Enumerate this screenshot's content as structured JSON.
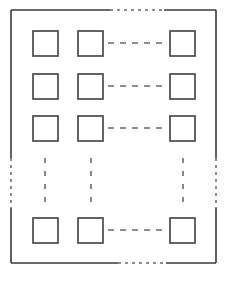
{
  "figure": {
    "background_color": "#ffffff",
    "line_color": "#3a3a3a",
    "dash_color": "#6a6a6a",
    "cell_stroke_color": "#4a4a4a",
    "cell_fill_color": "#ffffff",
    "width": 231,
    "height": 282
  },
  "boundary": {
    "name": "outer-frame",
    "left": 11,
    "top": 10,
    "right": 216,
    "bottom": 263,
    "segments": [
      {
        "id": "top-left-solid",
        "orientation": "horizontal",
        "style": "solid",
        "x1": 11,
        "y1": 10,
        "x2": 110,
        "y2": 10
      },
      {
        "id": "top-middle-dashed",
        "orientation": "horizontal",
        "style": "dashed",
        "x1": 110,
        "y1": 10,
        "x2": 164,
        "y2": 10
      },
      {
        "id": "top-right-solid",
        "orientation": "horizontal",
        "style": "solid",
        "x1": 164,
        "y1": 10,
        "x2": 216,
        "y2": 10
      },
      {
        "id": "right-upper-solid",
        "orientation": "vertical",
        "style": "solid",
        "x1": 216,
        "y1": 10,
        "x2": 216,
        "y2": 158
      },
      {
        "id": "right-middle-dashed",
        "orientation": "vertical",
        "style": "dashed",
        "x1": 216,
        "y1": 158,
        "x2": 216,
        "y2": 208
      },
      {
        "id": "right-lower-solid",
        "orientation": "vertical",
        "style": "solid",
        "x1": 216,
        "y1": 208,
        "x2": 216,
        "y2": 263
      },
      {
        "id": "bottom-left-solid",
        "orientation": "horizontal",
        "style": "solid",
        "x1": 11,
        "y1": 263,
        "x2": 118,
        "y2": 263
      },
      {
        "id": "bottom-middle-dashed",
        "orientation": "horizontal",
        "style": "dashed",
        "x1": 118,
        "y1": 263,
        "x2": 166,
        "y2": 263
      },
      {
        "id": "bottom-right-solid",
        "orientation": "horizontal",
        "style": "solid",
        "x1": 166,
        "y1": 263,
        "x2": 216,
        "y2": 263
      },
      {
        "id": "left-upper-solid",
        "orientation": "vertical",
        "style": "solid",
        "x1": 11,
        "y1": 10,
        "x2": 11,
        "y2": 158
      },
      {
        "id": "left-middle-dashed",
        "orientation": "vertical",
        "style": "dashed",
        "x1": 11,
        "y1": 158,
        "x2": 11,
        "y2": 208
      },
      {
        "id": "left-lower-solid",
        "orientation": "vertical",
        "style": "solid",
        "x1": 11,
        "y1": 208,
        "x2": 11,
        "y2": 263
      }
    ]
  },
  "grid": {
    "rows": 4,
    "columns": 3,
    "cell_width": 25,
    "cell_height": 25,
    "column_x": [
      33,
      78,
      170
    ],
    "row_y": [
      31,
      74,
      116,
      218
    ],
    "row_labels": [
      "row-1",
      "row-2",
      "row-3",
      "row-n"
    ],
    "column_labels": [
      "col-1",
      "col-2",
      "col-n"
    ],
    "cells": [
      {
        "id": "cell-r1c1",
        "x": 33,
        "y": 31
      },
      {
        "id": "cell-r1c2",
        "x": 78,
        "y": 31
      },
      {
        "id": "cell-r1c3",
        "x": 170,
        "y": 31
      },
      {
        "id": "cell-r2c1",
        "x": 33,
        "y": 74
      },
      {
        "id": "cell-r2c2",
        "x": 78,
        "y": 74
      },
      {
        "id": "cell-r2c3",
        "x": 170,
        "y": 74
      },
      {
        "id": "cell-r3c1",
        "x": 33,
        "y": 116
      },
      {
        "id": "cell-r3c2",
        "x": 78,
        "y": 116
      },
      {
        "id": "cell-r3c3",
        "x": 170,
        "y": 116
      },
      {
        "id": "cell-r4c1",
        "x": 33,
        "y": 218
      },
      {
        "id": "cell-r4c2",
        "x": 78,
        "y": 218
      },
      {
        "id": "cell-r4c3",
        "x": 170,
        "y": 218
      }
    ]
  },
  "ellipses": {
    "horizontal": [
      {
        "id": "h-ellipsis-row-1",
        "x1": 108,
        "y1": 43,
        "x2": 166,
        "y2": 43
      },
      {
        "id": "h-ellipsis-row-2",
        "x1": 108,
        "y1": 86,
        "x2": 166,
        "y2": 86
      },
      {
        "id": "h-ellipsis-row-3",
        "x1": 108,
        "y1": 128,
        "x2": 166,
        "y2": 128
      },
      {
        "id": "h-ellipsis-row-4",
        "x1": 108,
        "y1": 230,
        "x2": 166,
        "y2": 230
      }
    ],
    "vertical": [
      {
        "id": "v-ellipsis-col-1",
        "x1": 45,
        "y1": 158,
        "x2": 45,
        "y2": 205
      },
      {
        "id": "v-ellipsis-col-2",
        "x1": 91,
        "y1": 158,
        "x2": 91,
        "y2": 205
      },
      {
        "id": "v-ellipsis-col-3",
        "x1": 183,
        "y1": 158,
        "x2": 183,
        "y2": 205
      }
    ]
  }
}
